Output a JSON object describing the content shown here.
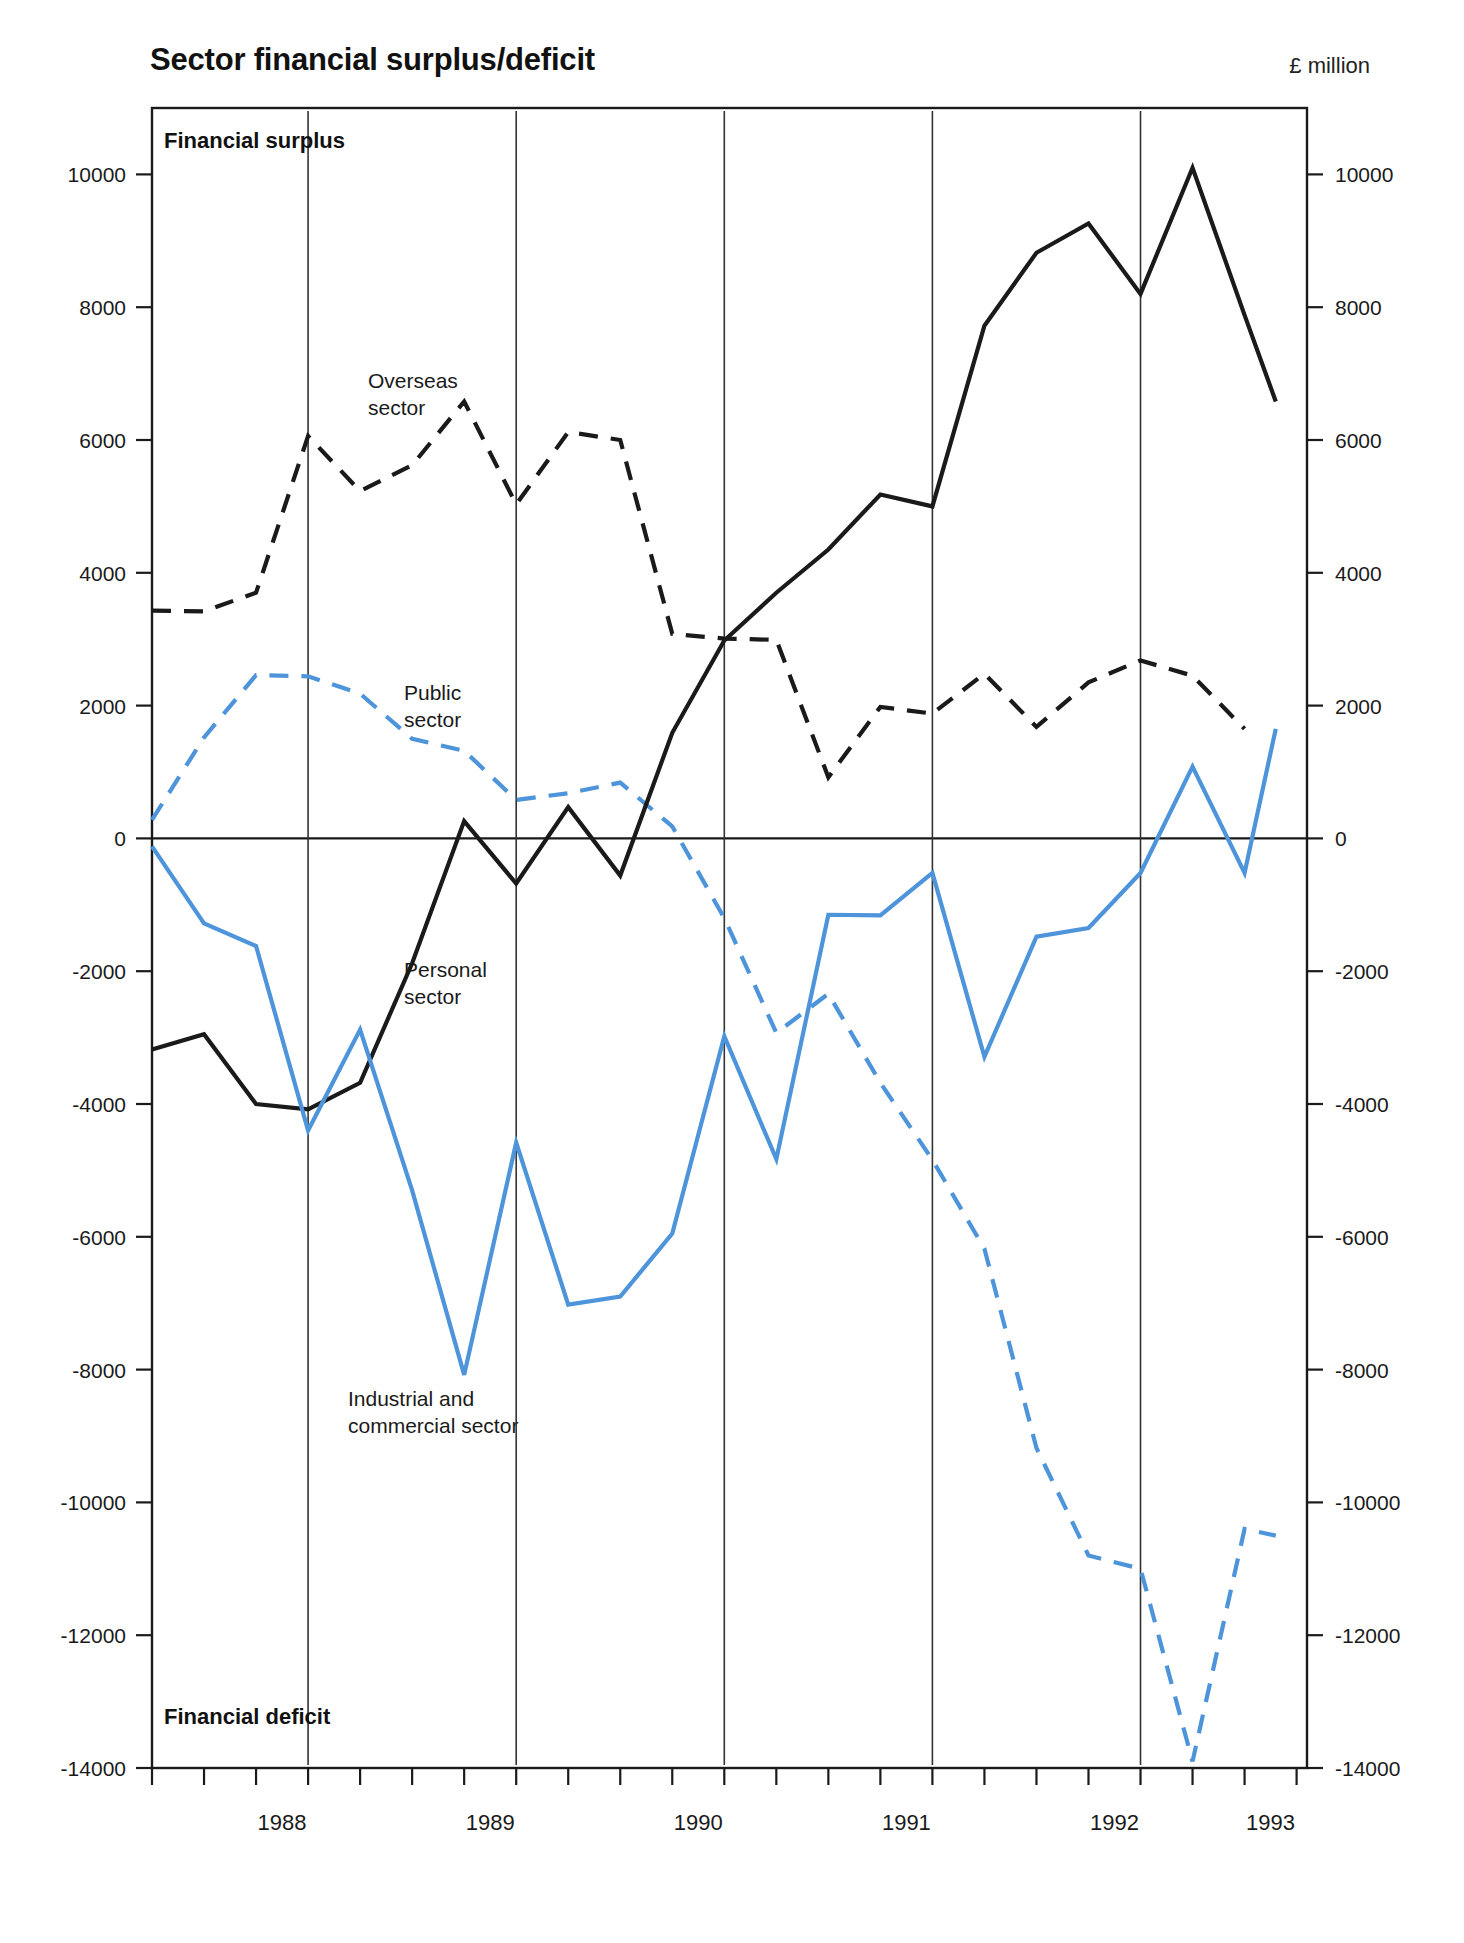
{
  "header": {
    "title": "Sector financial surplus/deficit",
    "unit": "£ million"
  },
  "zones": {
    "surplus": "Financial surplus",
    "deficit": "Financial deficit"
  },
  "annotations": [
    {
      "name": "overseas-sector-label",
      "lines": [
        "Overseas",
        "sector"
      ],
      "color": "#1a1a1a",
      "x": 368,
      "y": 388
    },
    {
      "name": "public-sector-label",
      "lines": [
        "Public",
        "sector"
      ],
      "color": "#4d94db",
      "x": 404,
      "y": 700
    },
    {
      "name": "personal-sector-label",
      "lines": [
        "Personal",
        "sector"
      ],
      "color": "#1a1a1a",
      "x": 404,
      "y": 977
    },
    {
      "name": "industrial-commercial-sector-label",
      "lines": [
        "Industrial and",
        "commercial sector"
      ],
      "color": "#4d94db",
      "x": 348,
      "y": 1406
    }
  ],
  "chart_data": {
    "type": "line",
    "title": "Sector financial surplus/deficit",
    "xlabel": "",
    "ylabel": "£ million",
    "ylim": [
      -14000,
      11000
    ],
    "yticks": [
      10000,
      8000,
      6000,
      4000,
      2000,
      0,
      -2000,
      -4000,
      -6000,
      -8000,
      -10000,
      -12000,
      -14000
    ],
    "ytick_labels": [
      "10000",
      "8000",
      "6000",
      "4000",
      "2000",
      "0",
      "-2000",
      "-4000",
      "-6000",
      "-8000",
      "-10000",
      "-12000",
      "-14000"
    ],
    "y_axis_both_sides": true,
    "grid": false,
    "legend": "inline-annotations",
    "xlim": [
      1987.75,
      1993.3
    ],
    "x_year_labels": [
      "1988",
      "1989",
      "1990",
      "1991",
      "1992",
      "1993"
    ],
    "x_year_label_positions": [
      1988.375,
      1989.375,
      1990.375,
      1991.375,
      1992.375,
      1993.125
    ],
    "x_minor_ticks_per_year": 4,
    "year_separators": [
      1988.5,
      1989.5,
      1990.5,
      1991.5,
      1992.5
    ],
    "x": [
      1987.75,
      1988.0,
      1988.25,
      1988.5,
      1988.75,
      1989.0,
      1989.25,
      1989.5,
      1989.75,
      1990.0,
      1990.25,
      1990.5,
      1990.75,
      1991.0,
      1991.25,
      1991.5,
      1991.75,
      1992.0,
      1992.25,
      1992.5,
      1992.75,
      1993.0,
      1993.15
    ],
    "series": [
      {
        "name": "Overseas sector",
        "color": "#1a1a1a",
        "style": "dashed",
        "values": [
          3430,
          3420,
          3700,
          6060,
          5230,
          5620,
          6580,
          5030,
          6120,
          6000,
          3080,
          3010,
          2990,
          920,
          1980,
          1880,
          2480,
          1680,
          2350,
          2680,
          2450,
          1650,
          null
        ]
      },
      {
        "name": "Public sector",
        "color": "#4d94db",
        "style": "dashed",
        "values": [
          280,
          1520,
          2460,
          2440,
          2180,
          1500,
          1320,
          580,
          680,
          840,
          180,
          -1200,
          -2930,
          -2340,
          -3680,
          -4840,
          -6180,
          -9180,
          -10800,
          -11000,
          -13900,
          -10400,
          -10500
        ]
      },
      {
        "name": "Personal sector",
        "color": "#1a1a1a",
        "style": "solid",
        "values": [
          -3180,
          -2950,
          -4000,
          -4080,
          -3680,
          -1880,
          260,
          -680,
          470,
          -560,
          1590,
          2980,
          3700,
          4350,
          5180,
          5000,
          7720,
          8820,
          9260,
          8200,
          10100,
          7880,
          6580
        ]
      },
      {
        "name": "Industrial and commercial sector",
        "color": "#4d94db",
        "style": "solid",
        "values": [
          -120,
          -1280,
          -1620,
          -4400,
          -2880,
          -5300,
          -8080,
          -4580,
          -7020,
          -6900,
          -5950,
          -2980,
          -4830,
          -1150,
          -1160,
          -520,
          -3290,
          -1480,
          -1350,
          -520,
          1080,
          -520,
          1650
        ]
      }
    ]
  }
}
